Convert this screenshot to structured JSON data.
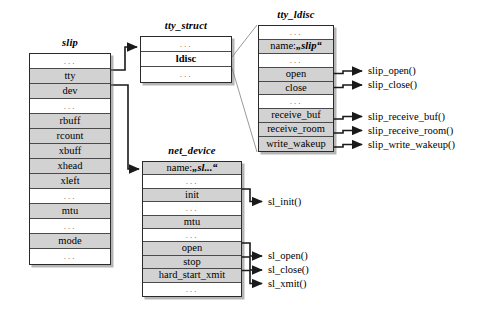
{
  "diagram": {
    "colors": {
      "field_fill": "#d2d2d2",
      "empty_fill": "#ffffff",
      "border": "#2a2a2a",
      "shadow": "#787878"
    }
  },
  "structs": {
    "slip": {
      "title": "slip",
      "rows": [
        {
          "label": "...",
          "kind": "ellipsis"
        },
        {
          "label": "tty",
          "kind": "field"
        },
        {
          "label": "dev",
          "kind": "field"
        },
        {
          "label": "...",
          "kind": "ellipsis"
        },
        {
          "label": "rbuff",
          "kind": "field"
        },
        {
          "label": "rcount",
          "kind": "field"
        },
        {
          "label": "xbuff",
          "kind": "field"
        },
        {
          "label": "xhead",
          "kind": "field"
        },
        {
          "label": "xleft",
          "kind": "field"
        },
        {
          "label": "...",
          "kind": "ellipsis"
        },
        {
          "label": "mtu",
          "kind": "field"
        },
        {
          "label": "...",
          "kind": "ellipsis"
        },
        {
          "label": "mode",
          "kind": "field"
        },
        {
          "label": "...",
          "kind": "ellipsis"
        }
      ]
    },
    "tty_struct": {
      "title": "tty_struct",
      "rows": [
        {
          "label": "...",
          "kind": "ellipsis"
        },
        {
          "label": "ldisc",
          "kind": "field-bold"
        },
        {
          "label": "...",
          "kind": "ellipsis"
        }
      ]
    },
    "tty_ldisc": {
      "title": "tty_ldisc",
      "rows": [
        {
          "label": "...",
          "kind": "ellipsis"
        },
        {
          "label": "name: „slip“",
          "kind": "field-name"
        },
        {
          "label": "...",
          "kind": "ellipsis"
        },
        {
          "label": "open",
          "kind": "field"
        },
        {
          "label": "close",
          "kind": "field"
        },
        {
          "label": "...",
          "kind": "ellipsis"
        },
        {
          "label": "receive_buf",
          "kind": "field"
        },
        {
          "label": "receive_room",
          "kind": "field"
        },
        {
          "label": "write_wakeup",
          "kind": "field"
        }
      ]
    },
    "net_device": {
      "title": "net_device",
      "rows": [
        {
          "label": "name: „sl...“",
          "kind": "field-name"
        },
        {
          "label": "...",
          "kind": "ellipsis"
        },
        {
          "label": "init",
          "kind": "field"
        },
        {
          "label": "...",
          "kind": "ellipsis"
        },
        {
          "label": "mtu",
          "kind": "field"
        },
        {
          "label": "...",
          "kind": "ellipsis"
        },
        {
          "label": "open",
          "kind": "field"
        },
        {
          "label": "stop",
          "kind": "field"
        },
        {
          "label": "hard_start_xmit",
          "kind": "field"
        },
        {
          "label": "...",
          "kind": "ellipsis"
        }
      ]
    }
  },
  "callouts": {
    "ldisc": [
      {
        "label": "slip_open()"
      },
      {
        "label": "slip_close()"
      },
      {
        "label": "slip_receive_buf()"
      },
      {
        "label": "slip_receive_room()"
      },
      {
        "label": "slip_write_wakeup()"
      }
    ],
    "netdev": [
      {
        "label": "sl_init()"
      },
      {
        "label": "sl_open()"
      },
      {
        "label": "sl_close()"
      },
      {
        "label": "sl_xmit()"
      }
    ]
  }
}
